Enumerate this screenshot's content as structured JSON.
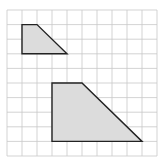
{
  "diagram": {
    "type": "grid-shapes",
    "grid": {
      "columns": 10,
      "rows": 10,
      "origin_px": [
        7,
        10
      ],
      "cell_width_px": 15,
      "cell_height_px": 14.6,
      "line_color": "#c8c8c8",
      "border_color": "#d0d0d0"
    },
    "shapes": [
      {
        "name": "small-trapezoid",
        "points_grid": [
          [
            1,
            1
          ],
          [
            2,
            1
          ],
          [
            4,
            3
          ],
          [
            1,
            3
          ]
        ],
        "fill": "#dcdcdc",
        "stroke": "#222222"
      },
      {
        "name": "large-trapezoid",
        "points_grid": [
          [
            3,
            5
          ],
          [
            5,
            5
          ],
          [
            9,
            9
          ],
          [
            3,
            9
          ]
        ],
        "fill": "#dcdcdc",
        "stroke": "#222222"
      }
    ]
  }
}
